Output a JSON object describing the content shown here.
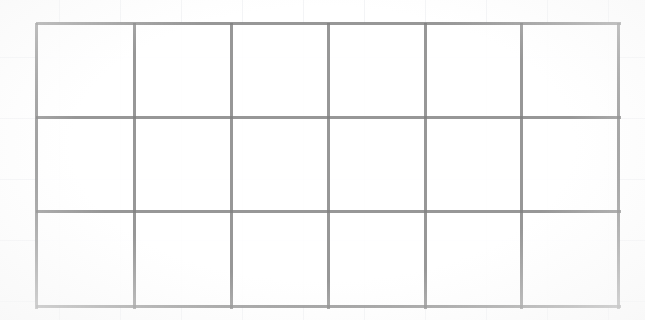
{
  "document": {
    "title": "Blank Grid Table",
    "background_color": "#ffffff",
    "line_color": "#808080",
    "paper_ruling_color": "#e8eaef"
  },
  "grid": {
    "columns": 6,
    "rows": 3,
    "left": 36,
    "top": 23,
    "right": 618,
    "bottom": 306,
    "width": 582,
    "height": 283,
    "line_width": 3,
    "column_edges": [
      36,
      134,
      231,
      328,
      425,
      521,
      618
    ],
    "row_edges": [
      23,
      117,
      211,
      306
    ],
    "cells": [
      [
        "",
        "",
        "",
        "",
        "",
        ""
      ],
      [
        "",
        "",
        "",
        "",
        "",
        ""
      ],
      [
        "",
        "",
        "",
        "",
        "",
        ""
      ]
    ]
  }
}
